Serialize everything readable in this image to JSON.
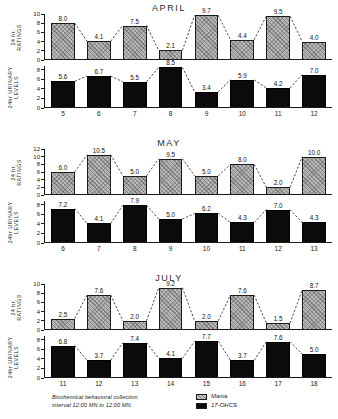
{
  "figure": {
    "caption_line1": "Biochemical  behavioral  collection",
    "caption_line2": "interval  12:00 MN  to 12:00 MN."
  },
  "legend": {
    "items": [
      {
        "label": "Mania",
        "swatch": "hatched-gray",
        "color": "#b9b9b9"
      },
      {
        "label": "17-OHCS",
        "swatch": "solid-black",
        "color": "#0b0b0b"
      }
    ]
  },
  "axis_titles": {
    "ratings_line1": "24 hr.",
    "ratings_line2": "RATINGS",
    "urinary_line1": "24hr URINARY",
    "urinary_line2": "LEVELS"
  },
  "panels": [
    {
      "title": "APRIL",
      "days": [
        "5",
        "6",
        "7",
        "8",
        "9",
        "10",
        "11",
        "12"
      ],
      "ratings": {
        "ticks": [
          "0",
          "2",
          "4",
          "6",
          "8",
          "10"
        ],
        "max": 10,
        "values": [
          8.0,
          4.1,
          7.5,
          2.1,
          9.7,
          4.4,
          9.5,
          4.0
        ],
        "labels": [
          "8.0",
          "4.1",
          "7.5",
          "2.1",
          "9.7",
          "4.4",
          "9.5",
          "4.0"
        ]
      },
      "urinary": {
        "ticks": [
          "0",
          "2",
          "4",
          "6",
          "8"
        ],
        "max": 8.8,
        "values": [
          5.6,
          6.7,
          5.5,
          8.5,
          3.4,
          5.9,
          4.2,
          7.0
        ],
        "labels": [
          "5.6",
          "6.7",
          "5.5",
          "8.5",
          "3.4",
          "5.9",
          "4.2",
          "7.0"
        ]
      }
    },
    {
      "title": "MAY",
      "days": [
        "6",
        "7",
        "8",
        "9",
        "10",
        "11",
        "12",
        "13"
      ],
      "ratings": {
        "ticks": [
          "0",
          "2",
          "4",
          "6",
          "8",
          "10",
          "12"
        ],
        "max": 12,
        "values": [
          6.0,
          10.5,
          5.0,
          9.5,
          5.0,
          8.0,
          2.0,
          10.0
        ],
        "labels": [
          "6.0",
          "10.5",
          "5.0",
          "9.5",
          "5.0",
          "8.0",
          "2.0",
          "10.0"
        ]
      },
      "urinary": {
        "ticks": [
          "0",
          "2",
          "4",
          "6",
          "8"
        ],
        "max": 8.8,
        "values": [
          7.2,
          4.1,
          7.9,
          5.0,
          6.2,
          4.3,
          7.0,
          4.3
        ],
        "labels": [
          "7.2",
          "4.1",
          "7.9",
          "5.0",
          "6.2",
          "4.3",
          "7.0",
          "4.3"
        ]
      }
    },
    {
      "title": "JULY",
      "days": [
        "11",
        "12",
        "13",
        "14",
        "15",
        "16",
        "17",
        "18"
      ],
      "ratings": {
        "ticks": [
          "0",
          "2",
          "4",
          "6",
          "8",
          "10"
        ],
        "max": 10,
        "values": [
          2.5,
          7.6,
          2.0,
          9.2,
          2.0,
          7.6,
          1.5,
          8.7
        ],
        "labels": [
          "2.5",
          "7.6",
          "2.0",
          "9.2",
          "2.0",
          "7.6",
          "1.5",
          "8.7"
        ]
      },
      "urinary": {
        "ticks": [
          "0",
          "2",
          "4",
          "6",
          "8"
        ],
        "max": 8.8,
        "values": [
          6.8,
          3.7,
          7.4,
          4.1,
          7.7,
          3.7,
          7.6,
          5.0
        ],
        "labels": [
          "6.8",
          "3.7",
          "7.4",
          "4.1",
          "7.7",
          "3.7",
          "7.6",
          "5.0"
        ]
      }
    }
  ],
  "chart_data": {
    "type": "bar",
    "xlabel": "Day of month",
    "ylabel": "Rating / 17-OHCS level",
    "grid": false,
    "legend_position": "bottom-right",
    "annotations": [
      "Biochemical behavioral collection interval 12:00 MN to 12:00 MN."
    ],
    "panels": [
      {
        "name": "APRIL",
        "categories": [
          "5",
          "6",
          "7",
          "8",
          "9",
          "10",
          "11",
          "12"
        ],
        "series": [
          {
            "name": "Mania",
            "ylabel": "24 hr. RATINGS",
            "ylim": [
              0,
              10
            ],
            "yticks": [
              0,
              2,
              4,
              6,
              8,
              10
            ],
            "values": [
              8.0,
              4.1,
              7.5,
              2.1,
              9.7,
              4.4,
              9.5,
              4.0
            ]
          },
          {
            "name": "17-OHCS",
            "ylabel": "24hr URINARY LEVELS",
            "ylim": [
              0,
              8
            ],
            "yticks": [
              0,
              2,
              4,
              6,
              8
            ],
            "values": [
              5.6,
              6.7,
              5.5,
              8.5,
              3.4,
              5.9,
              4.2,
              7.0
            ]
          }
        ]
      },
      {
        "name": "MAY",
        "categories": [
          "6",
          "7",
          "8",
          "9",
          "10",
          "11",
          "12",
          "13"
        ],
        "series": [
          {
            "name": "Mania",
            "ylabel": "24 hr. RATINGS",
            "ylim": [
              0,
              12
            ],
            "yticks": [
              0,
              2,
              4,
              6,
              8,
              10,
              12
            ],
            "values": [
              6.0,
              10.5,
              5.0,
              9.5,
              5.0,
              8.0,
              2.0,
              10.0
            ]
          },
          {
            "name": "17-OHCS",
            "ylabel": "24hr URINARY LEVELS",
            "ylim": [
              0,
              8
            ],
            "yticks": [
              0,
              2,
              4,
              6,
              8
            ],
            "values": [
              7.2,
              4.1,
              7.9,
              5.0,
              6.2,
              4.3,
              7.0,
              4.3
            ]
          }
        ]
      },
      {
        "name": "JULY",
        "categories": [
          "11",
          "12",
          "13",
          "14",
          "15",
          "16",
          "17",
          "18"
        ],
        "series": [
          {
            "name": "Mania",
            "ylabel": "24 hr. RATINGS",
            "ylim": [
              0,
              10
            ],
            "yticks": [
              0,
              2,
              4,
              6,
              8,
              10
            ],
            "values": [
              2.5,
              7.6,
              2.0,
              9.2,
              2.0,
              7.6,
              1.5,
              8.7
            ]
          },
          {
            "name": "17-OHCS",
            "ylabel": "24hr URINARY LEVELS",
            "ylim": [
              0,
              8
            ],
            "yticks": [
              0,
              2,
              4,
              6,
              8
            ],
            "values": [
              6.8,
              3.7,
              7.4,
              4.1,
              7.7,
              3.7,
              7.6,
              5.0
            ]
          }
        ]
      }
    ]
  }
}
